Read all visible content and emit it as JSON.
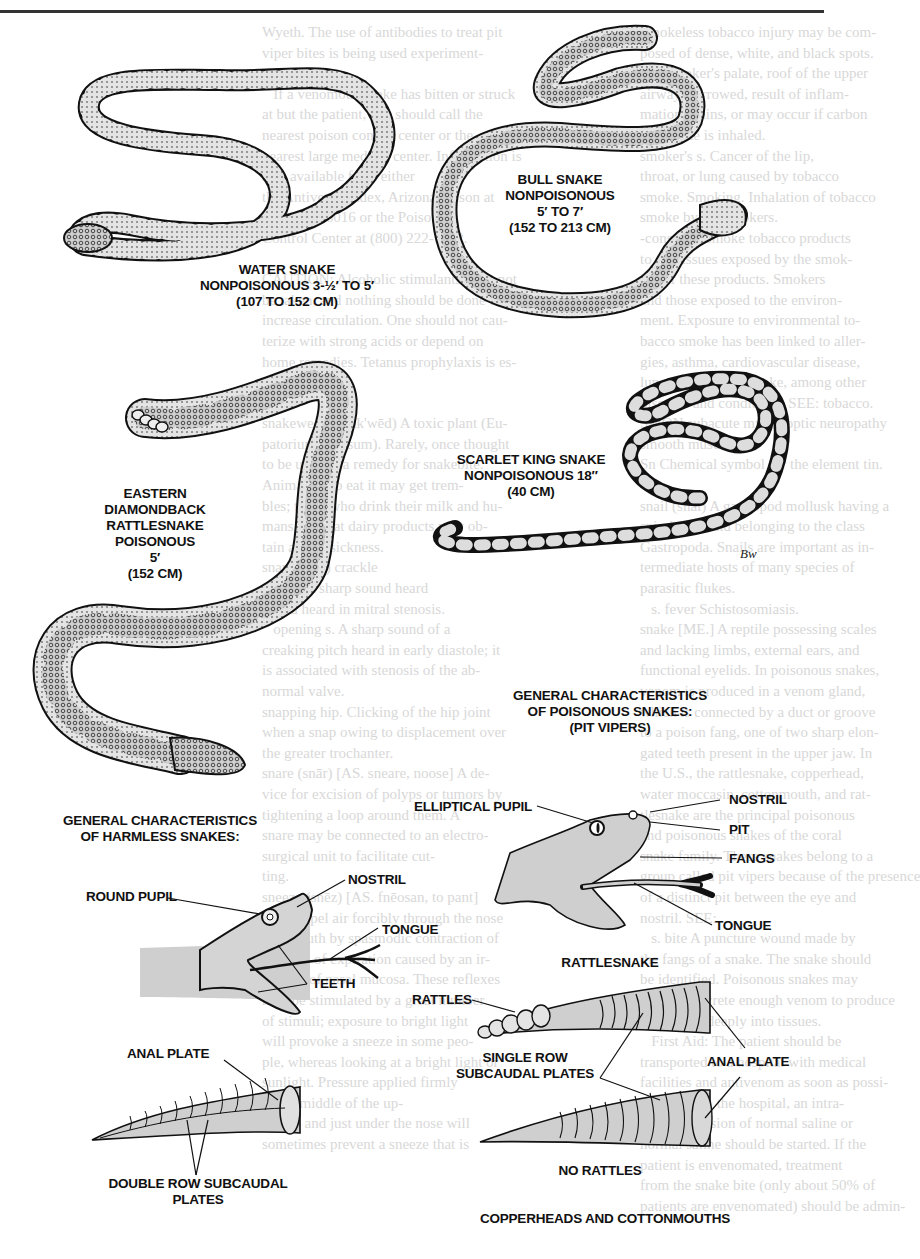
{
  "page": {
    "background_text_left": "Wyeth. The use of antibodies to treat pit\nviper bites is being used experiment-\nally.\n   If a venomous snake has bitten or struck\nat but the patient, one should call the\nnearest poison control center or the\nnearest large medical center. Information is\nalso available from either\nthe Antivenin Index, Arizona poison at\n(520) 626-6016 or the Poison\nControl Center at (800) 222-1222.\n\nCAUTION: Alcoholic stimulants must not\nbe taken, and nothing should be done to\nincrease circulation. One should not cau-\nterize with strong acids or depend on\nhome remedies. Tetanus prophylaxis is es-\nsential.\n\nsnakeweed (snāk'wēd) A toxic plant (Eu-\npatorium rugosum). Rarely, once thought\nto be used as a remedy for snakebite.\nAnimals who eat it may get trem-\nbles; those who drink their milk and hu-\nmans who eat dairy products may ob-\ntain a milk sickness.\nsnap (snap) crackle\n   click A sharp sound heard\nsound heard in mitral stenosis.\n   opening s. A sharp sound of a\ncreaking pitch heard in early diastole; it\nis associated with stenosis of the ab-\nnormal valve.\nsnapping hip. Clicking of the hip joint\nwhen a snap owing to displacement over\nthe greater trochanter.\nsnare (snār) [AS. sneare, noose] A de-\nvice for excision of polyps or tumors by\ntightening a loop around them. A\nsnare may be connected to an electro-\nsurgical unit to facilitate cut-\nting.\nsneeze (snēz) [AS. fnēosan, to pant]\n1. To expel air forcibly through the nose\nand mouth by spasmodic contraction of\nmuscles of expiration caused by an ir-\nritation of nasal mucosa. These reflexes\nmay be stimulated by a great number\nof stimuli; exposure to bright light\nwill provoke a sneeze in some peo-\nple, whereas looking at a bright light or\nsunlight. Pressure applied firmly\nto the middle of the up-\nper lip and just under the nose will\nsometimes prevent a sneeze that is",
    "background_text_right": "Smokeless tobacco injury may be com-\nposed of dense, white, and black spots.\nThe smoker's palate, roof of the upper\nairway, narrowed, result of inflam-\nmation, stains, or may occur if carbon\nmonoxide is inhaled.\nsmoker's s. Cancer of the lip,\nthroat, or lung caused by tobacco\nsmoke. Smoking. Inhalation of tobacco\nsmoke by nonsmokers.\n-cons who smoke tobacco products\nto the tissues exposed by the smok-\ning of these products. Smokers\nand those exposed to the environ-\nment. Exposure to environmental to-\nbacco smoke has been linked to aller-\ngies, asthma, cardiovascular disease,\nlung disease, and stroke, among other\ndiseases and conditions. SEE: tobacco.\nSMON subacute myelo-optic neuropathy\nsmooth muscle ...\nSn Chemical symbol for the element tin.\n\nsnail (snāl) A gastropod mollusk having a\nspiral shell and belonging to the class\nGastropoda. Snails are important as in-\ntermediate hosts of many species of\nparasitic flukes.\n   s. fever Schistosomiasis.\nsnake [ME.] A reptile possessing scales\nand lacking limbs, external ears, and\nfunctional eyelids. In poisonous snakes,\nvenom is produced in a venom gland,\nwhich is connected by a duct or groove\nto a poison fang, one of two sharp elon-\ngated teeth present in the upper jaw. In\nthe U.S., the rattlesnake, copperhead,\nwater moccasin, cottonmouth, and rat-\ntlesnake are the principal poisonous\nand poisonous snakes of the coral\nsnake family. These snakes belong to a\ngroup called pit vipers because of the presence\nof a distinct pit between the eye and\nnostril. SEE: ...\n   s. bite A puncture wound made by\nthe fangs of a snake. The snake should\nbe identified. Poisonous snakes may\ninject or secrete enough venom to produce\npoisoning, deeply into tissues.\n   First Aid: The patient should be\ntransported to a hospital with medical\nfacilities and antivenom as soon as possi-\nble. Once in the hospital, an intra-\nvenous infusion of normal saline or\nnormal saline should be started. If the\npatient is envenomated, treatment\nfrom the snake bite (only about 50% of\npatients are envenomated) should be admin-"
  },
  "snakes": [
    {
      "id": "water-snake",
      "name": "WATER SNAKE",
      "status": "NONPOISONOUS 3-½′ TO 5′",
      "metric": "(107 TO 152 CM)"
    },
    {
      "id": "bull-snake",
      "name": "BULL SNAKE",
      "status": "NONPOISONOUS",
      "length": "5′ TO 7′",
      "metric": "(152 TO 213 CM)"
    },
    {
      "id": "scarlet-king-snake",
      "name": "SCARLET KING SNAKE",
      "status": "NONPOISONOUS 18″",
      "metric": "(40 CM)"
    },
    {
      "id": "eastern-diamondback",
      "name_line1": "EASTERN",
      "name_line2": "DIAMONDBACK",
      "name_line3": "RATTLESNAKE",
      "status": "POISONOUS",
      "length": "5′",
      "metric": "(152 CM)"
    }
  ],
  "artist_signature": "BW",
  "harmless": {
    "title_line1": "GENERAL CHARACTERISTICS",
    "title_line2": "OF HARMLESS SNAKES:",
    "labels": {
      "round_pupil": "ROUND PUPIL",
      "nostril": "NOSTRIL",
      "tongue": "TONGUE",
      "teeth": "TEETH",
      "anal_plate": "ANAL PLATE",
      "subcaudal_line1": "DOUBLE ROW SUBCAUDAL",
      "subcaudal_line2": "PLATES"
    }
  },
  "poisonous": {
    "title_line1": "GENERAL CHARACTERISTICS",
    "title_line2": "OF POISONOUS SNAKES:",
    "title_line3": "(PIT VIPERS)",
    "labels": {
      "elliptical_pupil": "ELLIPTICAL PUPIL",
      "nostril": "NOSTRIL",
      "pit": "PIT",
      "fangs": "FANGS",
      "tongue": "TONGUE",
      "head_caption": "RATTLESNAKE",
      "rattles": "RATTLES",
      "subcaudal_line1": "SINGLE ROW",
      "subcaudal_line2": "SUBCAUDAL PLATES",
      "anal_plate": "ANAL PLATE",
      "no_rattles": "NO RATTLES",
      "tail_caption": "COPPERHEADS AND COTTONMOUTHS"
    }
  },
  "colors": {
    "ink": "#111111",
    "shade": "#cfcfcf",
    "light_shade": "#e6e6e6",
    "bleed_text": "#d8d8d8",
    "rule": "#333333"
  }
}
